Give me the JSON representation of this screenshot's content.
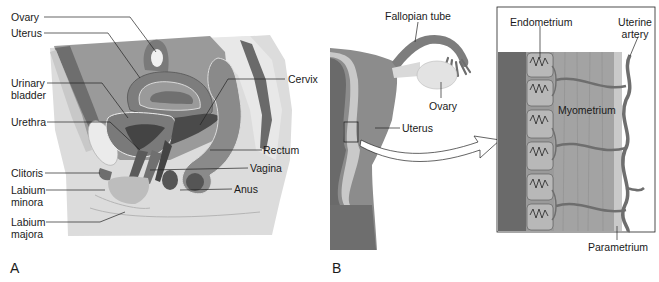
{
  "figure": {
    "panels": [
      {
        "letter": "A",
        "title": "Sagittal section of female pelvis",
        "labels": {
          "ovary": "Ovary",
          "uterus": "Uterus",
          "urinary_bladder_1": "Urinary",
          "urinary_bladder_2": "bladder",
          "urethra": "Urethra",
          "clitoris": "Clitoris",
          "labium_minora_1": "Labium",
          "labium_minora_2": "minora",
          "labium_majora_1": "Labium",
          "labium_majora_2": "majora",
          "cervix": "Cervix",
          "rectum": "Rectum",
          "vagina": "Vagina",
          "anus": "Anus"
        }
      },
      {
        "letter": "B",
        "title": "Uterus with magnified wall section",
        "labels": {
          "fallopian_tube": "Fallopian tube",
          "ovary": "Ovary",
          "uterus": "Uterus",
          "endometrium": "Endometrium",
          "uterine_artery_1": "Uterine",
          "uterine_artery_2": "artery",
          "myometrium": "Myometrium",
          "parametrium": "Parametrium"
        }
      }
    ],
    "colors": {
      "background": "#ffffff",
      "tissue_dark": "#6e6e6e",
      "tissue_mid": "#8c8c8c",
      "tissue_light": "#bdbdbd",
      "skin": "#d9d9d9",
      "bone": "#e6e6e6",
      "line": "#1a1a1a"
    }
  }
}
